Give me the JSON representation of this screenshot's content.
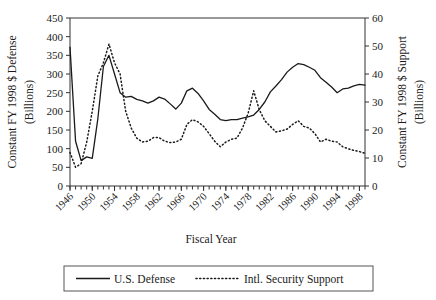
{
  "chart_data": {
    "type": "line",
    "title": "",
    "xlabel": "Fiscal Year",
    "ylabel": "Constant FY 1998 $ Defense (Billions)",
    "ylabel_line1": "Constant FY 1998 $ Defense",
    "ylabel_line2": "(Billions)",
    "y2label": "Constant FY 1998 $ Support (Billions)",
    "y2label_line1": "Constant FY 1998 $ Support",
    "y2label_line2": "(Billions)",
    "xlim": [
      1946,
      1999
    ],
    "ylim": [
      0,
      450
    ],
    "y2lim": [
      0,
      60
    ],
    "yticks": [
      0,
      50,
      100,
      150,
      200,
      250,
      300,
      350,
      400,
      450
    ],
    "y2ticks": [
      0,
      10,
      20,
      30,
      40,
      50,
      60
    ],
    "xticks": [
      1946,
      1950,
      1954,
      1958,
      1962,
      1966,
      1970,
      1974,
      1978,
      1982,
      1986,
      1990,
      1994,
      1998
    ],
    "xtick_labels": [
      "1946",
      "1950",
      "1954",
      "1958",
      "1962",
      "1966",
      "1970",
      "1974",
      "1978",
      "1982",
      "1986",
      "1990",
      "1994",
      "1998"
    ],
    "xtick_minor_step": 1,
    "grid": false,
    "legend_position": "bottom-outside",
    "x": [
      1946,
      1947,
      1948,
      1949,
      1950,
      1951,
      1952,
      1953,
      1954,
      1955,
      1956,
      1957,
      1958,
      1959,
      1960,
      1961,
      1962,
      1963,
      1964,
      1965,
      1966,
      1967,
      1968,
      1969,
      1970,
      1971,
      1972,
      1973,
      1974,
      1975,
      1976,
      1977,
      1978,
      1979,
      1980,
      1981,
      1982,
      1983,
      1984,
      1985,
      1986,
      1987,
      1988,
      1989,
      1990,
      1991,
      1992,
      1993,
      1994,
      1995,
      1996,
      1997,
      1998,
      1999
    ],
    "series": [
      {
        "name": "U.S. Defense",
        "axis": "left",
        "style": "solid",
        "color": "#1a1a1a",
        "units": "Billions of constant FY 1998 dollars",
        "values": [
          372,
          120,
          68,
          78,
          74,
          180,
          320,
          350,
          300,
          250,
          238,
          240,
          232,
          228,
          222,
          228,
          238,
          233,
          220,
          206,
          222,
          255,
          262,
          248,
          228,
          205,
          192,
          178,
          175,
          178,
          178,
          182,
          185,
          190,
          205,
          225,
          252,
          268,
          285,
          305,
          318,
          328,
          325,
          318,
          310,
          290,
          278,
          265,
          250,
          260,
          262,
          268,
          272,
          270
        ]
      },
      {
        "name": "Intl. Security Support",
        "axis": "right",
        "style": "dotted",
        "color": "#1a1a1a",
        "units": "Billions of constant FY 1998 dollars",
        "values_left_scale": [
          90,
          50,
          60,
          118,
          200,
          295,
          330,
          380,
          330,
          300,
          200,
          155,
          128,
          118,
          120,
          130,
          130,
          120,
          116,
          118,
          125,
          165,
          178,
          172,
          160,
          140,
          120,
          105,
          118,
          125,
          128,
          155,
          195,
          255,
          205,
          175,
          160,
          145,
          148,
          152,
          165,
          175,
          160,
          155,
          140,
          118,
          125,
          120,
          118,
          105,
          100,
          95,
          92,
          88
        ],
        "values": [
          12,
          6.7,
          8,
          15.7,
          26.7,
          39.3,
          44,
          50.7,
          44,
          40,
          26.7,
          20.7,
          17.1,
          15.7,
          16,
          17.3,
          17.3,
          16,
          15.5,
          15.7,
          16.7,
          22,
          23.7,
          22.9,
          21.3,
          18.7,
          16,
          14,
          15.7,
          16.7,
          17.1,
          20.7,
          26,
          34,
          27.3,
          23.3,
          21.3,
          19.3,
          19.7,
          20.3,
          22,
          23.3,
          21.3,
          20.7,
          18.7,
          15.7,
          16.7,
          16,
          15.7,
          14,
          13.3,
          12.7,
          12.3,
          11.7
        ]
      }
    ],
    "legend": [
      {
        "label": "U.S. Defense",
        "style": "solid"
      },
      {
        "label": "Intl. Security Support",
        "style": "dotted"
      }
    ]
  }
}
